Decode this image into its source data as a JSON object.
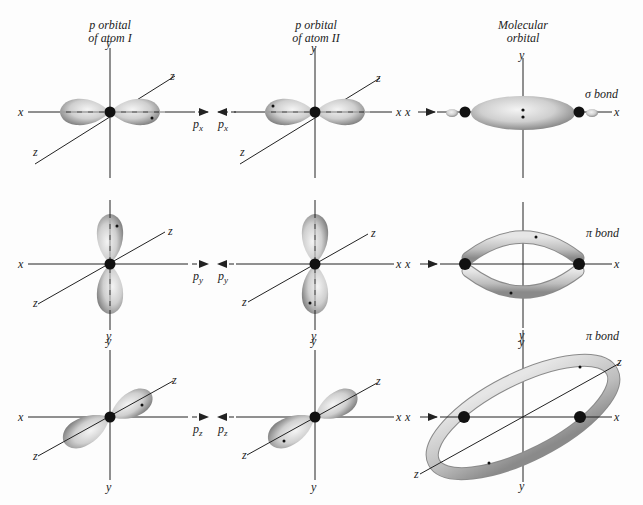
{
  "headers": {
    "col1": [
      "p orbital",
      "of atom I"
    ],
    "col2": [
      "p orbital",
      "of atom II"
    ],
    "col3": [
      "Molecular",
      "orbital"
    ]
  },
  "axis_labels": {
    "x": "x",
    "y": "y",
    "z": "z"
  },
  "rows": [
    {
      "orbital": "px",
      "sub": "x",
      "label_left": "p",
      "label_right": "p",
      "bond": "σ bond"
    },
    {
      "orbital": "py",
      "sub": "y",
      "label_left": "p",
      "label_right": "p",
      "bond": "π bond"
    },
    {
      "orbital": "pz",
      "sub": "z",
      "label_left": "p",
      "label_right": "p",
      "bond": "π bond"
    }
  ],
  "colors": {
    "lobe": "#c9c9c9",
    "lobe_dark": "#8a8a8a",
    "nucleus": "#111111",
    "line": "#222222",
    "bg": "#fdfdfd"
  }
}
